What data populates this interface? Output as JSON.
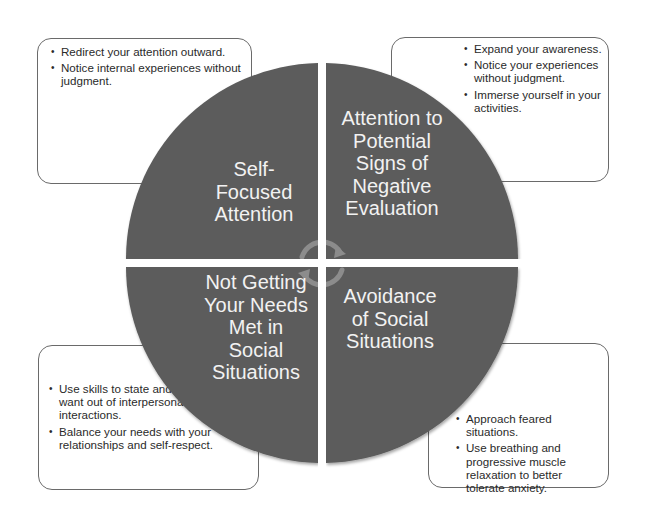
{
  "diagram": {
    "type": "four-quadrant cycle",
    "colors": {
      "quadrant_fill": "#5b5b5b",
      "quadrant_text": "#f2f2f2",
      "cycle_arrow": "#8c8c8c",
      "note_border": "#6a6a6a",
      "note_text": "#2a2a2a"
    },
    "quadrants": [
      {
        "position": "top-left",
        "label": "Self-\nFocused\nAttention"
      },
      {
        "position": "top-right",
        "label": "Attention to\nPotential\nSigns of\nNegative\nEvaluation"
      },
      {
        "position": "bottom-left",
        "label": "Not Getting\nYour Needs\nMet in\nSocial\nSituations"
      },
      {
        "position": "bottom-right",
        "label": "Avoidance\nof Social\nSituations"
      }
    ],
    "center_icon": "circular-cycle-arrows",
    "notes": {
      "top_left": [
        "Redirect your attention outward.",
        "Notice internal experiences without judgment."
      ],
      "top_right": [
        "Expand your awareness.",
        "Notice your experiences without judgment.",
        "Immerse yourself in your activities."
      ],
      "bottom_left": [
        "Use skills to state and get what you want out of interpersonal interactions.",
        "Balance your needs with your relationships and self-respect."
      ],
      "bottom_right": [
        "Approach feared situations.",
        "Use breathing and progressive muscle relaxation to better tolerate anxiety."
      ]
    }
  }
}
